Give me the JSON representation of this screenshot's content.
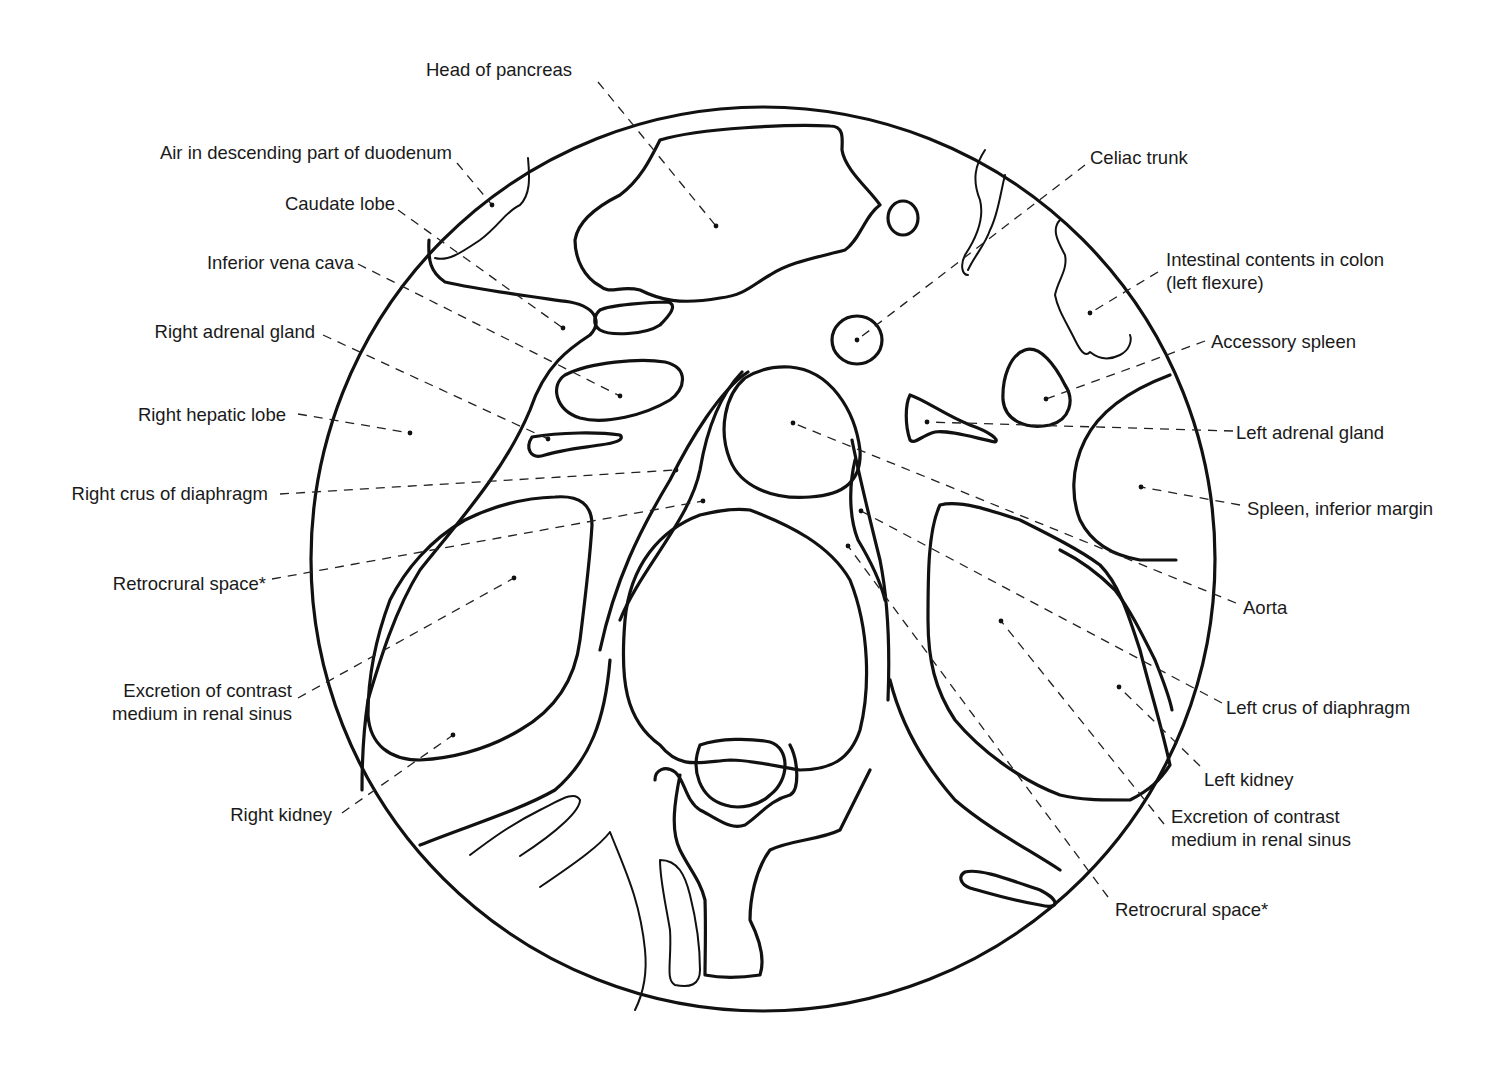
{
  "diagram": {
    "type": "anatomical-cross-section",
    "colors": {
      "line": "#111111",
      "background": "#ffffff",
      "text": "#1a1a1a"
    },
    "labels_left": [
      {
        "id": "head-of-pancreas",
        "text": "Head of pancreas"
      },
      {
        "id": "air-duodenum",
        "text": "Air in descending part of duodenum"
      },
      {
        "id": "caudate-lobe",
        "text": "Caudate lobe"
      },
      {
        "id": "inferior-vena-cava",
        "text": "Inferior vena cava"
      },
      {
        "id": "right-adrenal-gland",
        "text": "Right adrenal gland"
      },
      {
        "id": "right-hepatic-lobe",
        "text": "Right hepatic lobe"
      },
      {
        "id": "right-crus",
        "text": "Right crus of diaphragm"
      },
      {
        "id": "retrocrural-space-left",
        "text": "Retrocrural space*"
      },
      {
        "id": "excretion-right-line1",
        "text": "Excretion of contrast"
      },
      {
        "id": "excretion-right-line2",
        "text": "medium in renal sinus"
      },
      {
        "id": "right-kidney",
        "text": "Right kidney"
      }
    ],
    "labels_right": [
      {
        "id": "celiac-trunk",
        "text": "Celiac trunk"
      },
      {
        "id": "intestinal-line1",
        "text": "Intestinal contents in colon"
      },
      {
        "id": "intestinal-line2",
        "text": "(left flexure)"
      },
      {
        "id": "accessory-spleen",
        "text": "Accessory spleen"
      },
      {
        "id": "left-adrenal-gland",
        "text": "Left adrenal gland"
      },
      {
        "id": "spleen-inferior-margin",
        "text": "Spleen, inferior margin"
      },
      {
        "id": "aorta",
        "text": "Aorta"
      },
      {
        "id": "left-crus",
        "text": "Left crus of diaphragm"
      },
      {
        "id": "left-kidney",
        "text": "Left kidney"
      },
      {
        "id": "excretion-left-line1",
        "text": "Excretion of contrast"
      },
      {
        "id": "excretion-left-line2",
        "text": "medium in renal sinus"
      },
      {
        "id": "retrocrural-space-right",
        "text": "Retrocrural space*"
      }
    ]
  }
}
